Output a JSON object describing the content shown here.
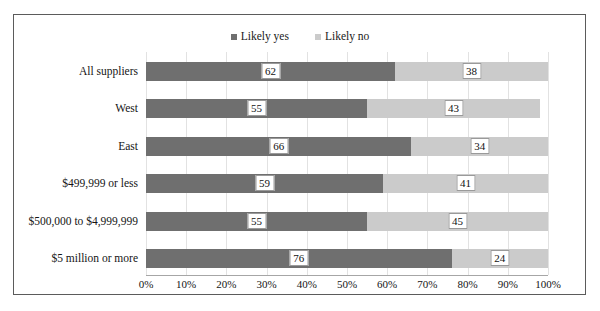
{
  "chart_data": {
    "type": "bar",
    "subtype": "stacked-horizontal-100-percent",
    "title": "",
    "xlabel": "",
    "ylabel": "",
    "xlim": [
      0,
      100
    ],
    "xticks": [
      "0%",
      "10%",
      "20%",
      "30%",
      "40%",
      "50%",
      "60%",
      "70%",
      "80%",
      "90%",
      "100%"
    ],
    "xtick_values": [
      0,
      10,
      20,
      30,
      40,
      50,
      60,
      70,
      80,
      90,
      100
    ],
    "grid": true,
    "grid_axis": "x",
    "legend_position": "top-center",
    "categories": [
      "All suppliers",
      "West",
      "East",
      "$499,999 or less",
      "$500,000 to $4,999,999",
      "$5 million or more"
    ],
    "series": [
      {
        "name": "Likely yes",
        "color": "#6f6f6f",
        "values": [
          62,
          55,
          66,
          59,
          55,
          76
        ]
      },
      {
        "name": "Likely no",
        "color": "#cbcbcb",
        "values": [
          38,
          43,
          34,
          41,
          45,
          24
        ]
      }
    ]
  },
  "legend": {
    "entries": [
      {
        "label": "Likely yes",
        "color": "#6f6f6f"
      },
      {
        "label": "Likely no",
        "color": "#cbcbcb"
      }
    ]
  },
  "colors": {
    "likely_yes": "#6f6f6f",
    "likely_no": "#cbcbcb",
    "frame": "#5b5b5b",
    "gridline": "#e2e2e2",
    "axis": "#a6a6a6",
    "background": "#ffffff"
  }
}
